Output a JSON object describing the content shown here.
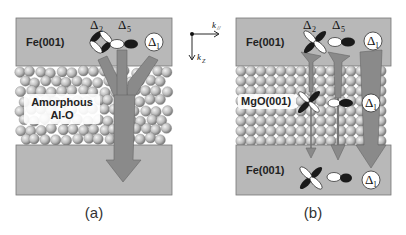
{
  "figure": {
    "panels": [
      {
        "id": "a",
        "caption": "(a)",
        "top_layer": "Fe(001)",
        "barrier_label_line1": "Amorphous",
        "barrier_label_line2": "Al-O",
        "bottom_layer": "",
        "states": [
          {
            "symbol": "Δ",
            "sub": "2"
          },
          {
            "symbol": "Δ",
            "sub": "5"
          },
          {
            "symbol": "Δ",
            "sub": "1"
          }
        ]
      },
      {
        "id": "b",
        "caption": "(b)",
        "top_layer": "Fe(001)",
        "barrier_label": "MgO(001)",
        "bottom_layer": "Fe(001)",
        "states": [
          {
            "symbol": "Δ",
            "sub": "2"
          },
          {
            "symbol": "Δ",
            "sub": "5"
          },
          {
            "symbol": "Δ",
            "sub": "1"
          }
        ]
      }
    ],
    "axes": {
      "k_parallel": "k",
      "k_parallel_sub": "//",
      "k_z": "k",
      "k_z_sub": "Z"
    },
    "colors": {
      "layer_fill": "#b8b8b8",
      "arrow_fill": "#8a8a8a",
      "orbital_dark": "#1a1a1a",
      "orbital_light": "#ffffff"
    }
  }
}
